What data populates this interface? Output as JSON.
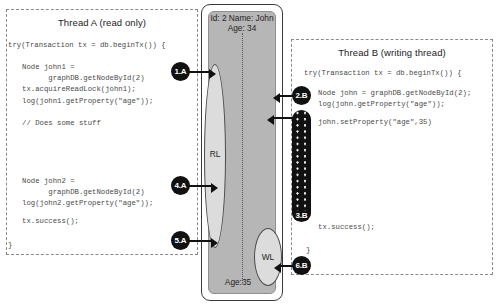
{
  "thread_a": {
    "title": "Thread A (read only)",
    "code_open": "try(Transaction tx = db.beginTx()) {",
    "code_block1": "Node john1 =\n      graphDB.getNodeById(2)\ntx.acquireReadLock(john1);\nlog(john1.getProperty(\"age\"));",
    "code_comment": "// Does some stuff",
    "code_block2": "Node john2 =\n      graphDB.getNodeById(2)\nlog(john2.getProperty(\"age\"));",
    "code_success": "tx.success();",
    "code_close": "}"
  },
  "thread_b": {
    "title": "Thread B (writing thread)",
    "code_open": "try(Transaction tx = db.beginTx()) {",
    "code_block1": "Node john = graphDB.getNodeById(2);\nlog(john.getProperty(\"age\"));",
    "code_set": "john.setProperty(\"age\",35)",
    "code_success": "tx.success();",
    "code_close": "}"
  },
  "node": {
    "props_top": "Id: 2\nName: John\nAge: 34",
    "prop_bottom": "Age:35",
    "read_lock_label": "RL",
    "write_lock_label": "WL"
  },
  "steps": {
    "s1a": "1.A",
    "s2b": "2.B",
    "s3b": "3.B",
    "s4a": "4.A",
    "s5a": "5.A",
    "s6b": "6.B"
  },
  "colors": {
    "badge": "#111111",
    "node_fill": "#b6b6b6",
    "lock_fill": "#dcdcdc",
    "panel_border": "#8a8a8a"
  }
}
